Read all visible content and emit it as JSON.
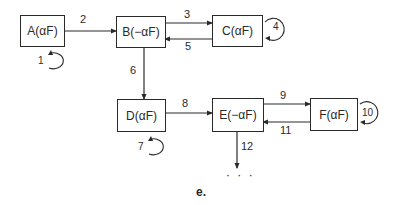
{
  "diagram": {
    "caption": "e.",
    "continuation": "· · ·",
    "nodes": [
      {
        "id": "A",
        "label": "A(αF)"
      },
      {
        "id": "B",
        "label": "B(−αF)"
      },
      {
        "id": "C",
        "label": "C(αF)"
      },
      {
        "id": "D",
        "label": "D(αF)"
      },
      {
        "id": "E",
        "label": "E(−αF)"
      },
      {
        "id": "F",
        "label": "F(αF)"
      }
    ],
    "edges": [
      {
        "label": "1",
        "from": "A",
        "to": "A",
        "type": "self-loop"
      },
      {
        "label": "2",
        "from": "A",
        "to": "B"
      },
      {
        "label": "3",
        "from": "B",
        "to": "C"
      },
      {
        "label": "4",
        "from": "C",
        "to": "C",
        "type": "self-loop"
      },
      {
        "label": "5",
        "from": "C",
        "to": "B"
      },
      {
        "label": "6",
        "from": "B",
        "to": "D"
      },
      {
        "label": "7",
        "from": "D",
        "to": "D",
        "type": "self-loop"
      },
      {
        "label": "8",
        "from": "D",
        "to": "E"
      },
      {
        "label": "9",
        "from": "E",
        "to": "F"
      },
      {
        "label": "10",
        "from": "F",
        "to": "F",
        "type": "self-loop"
      },
      {
        "label": "11",
        "from": "F",
        "to": "E"
      },
      {
        "label": "12",
        "from": "E",
        "to": "continuation"
      }
    ]
  }
}
